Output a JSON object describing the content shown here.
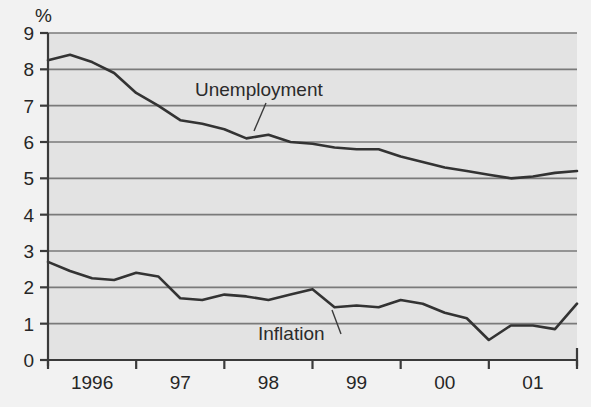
{
  "chart_data": {
    "type": "line",
    "title": "",
    "xlabel": "",
    "ylabel": "%",
    "ylim": [
      0,
      9
    ],
    "ytick_labels": [
      "0",
      "1",
      "2",
      "3",
      "4",
      "5",
      "6",
      "7",
      "8",
      "9"
    ],
    "ytick_values": [
      0,
      1,
      2,
      3,
      4,
      5,
      6,
      7,
      8,
      9
    ],
    "xtick_labels": [
      "1996",
      "97",
      "98",
      "99",
      "00",
      "01"
    ],
    "xlim": [
      1995.75,
      2001.75
    ],
    "grid": "horizontal",
    "legend": "inline-annotations",
    "plot_background": "#e3e3e3",
    "gridline_color": "#7a7a7a",
    "line_color": "#333333",
    "series": [
      {
        "name": "Unemployment",
        "label_x": 1997.1,
        "label_y": 7.55,
        "x": [
          1995.75,
          1996.0,
          1996.25,
          1996.5,
          1996.75,
          1997.0,
          1997.25,
          1997.5,
          1997.75,
          1998.0,
          1998.25,
          1998.5,
          1998.75,
          1999.0,
          1999.25,
          1999.5,
          1999.75,
          2000.0,
          2000.25,
          2000.5,
          2000.75,
          2001.0,
          2001.25,
          2001.5,
          2001.75
        ],
        "values": [
          8.25,
          8.4,
          8.2,
          7.9,
          7.35,
          7.0,
          6.6,
          6.5,
          6.35,
          6.1,
          6.2,
          6.0,
          5.95,
          5.85,
          5.8,
          5.8,
          5.6,
          5.45,
          5.3,
          5.2,
          5.1,
          5.0,
          5.05,
          5.15,
          5.2
        ]
      },
      {
        "name": "Inflation",
        "label_x": 1998.2,
        "label_y": 0.95,
        "x": [
          1995.75,
          1996.0,
          1996.25,
          1996.5,
          1996.75,
          1997.0,
          1997.25,
          1997.5,
          1997.75,
          1998.0,
          1998.25,
          1998.5,
          1998.75,
          1999.0,
          1999.25,
          1999.5,
          1999.75,
          2000.0,
          2000.25,
          2000.5,
          2000.75,
          2001.0,
          2001.25,
          2001.5,
          2001.75
        ],
        "values": [
          2.7,
          2.45,
          2.25,
          2.2,
          2.4,
          2.3,
          1.7,
          1.65,
          1.8,
          1.75,
          1.65,
          1.8,
          1.95,
          1.45,
          1.5,
          1.45,
          1.65,
          1.55,
          1.3,
          1.15,
          0.55,
          0.95,
          0.95,
          0.85,
          1.55
        ]
      }
    ],
    "series_tail": {
      "unemployment_note": "declining trend 1996-2001 with flattening near 5.0",
      "inflation_note": "oscillating 0.5-2.7 band"
    },
    "inflation_extra": {
      "x": [
        2001.25,
        2001.5,
        2001.75
      ],
      "values": [
        1.55,
        1.55,
        1.15
      ]
    }
  }
}
